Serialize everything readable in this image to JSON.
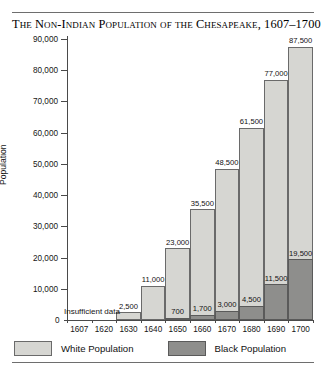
{
  "title": "The Non-Indian Population of the Chesapeake, 1607–1700",
  "axis": {
    "ylabel": "Population",
    "yticks": [
      "0",
      "10,000",
      "20,000",
      "30,000",
      "40,000",
      "50,000",
      "60,000",
      "70,000",
      "80,000",
      "90,000"
    ],
    "zero_label": "0"
  },
  "annotation": {
    "insufficient_data": "Insufficient data"
  },
  "legend": {
    "items": [
      {
        "label": "White Population",
        "color": "#d6d6d2",
        "swatch": "white-swatch"
      },
      {
        "label": "Black Population",
        "color": "#8e8e8c",
        "swatch": "black-swatch"
      }
    ]
  },
  "chart_data": {
    "type": "bar",
    "title": "The Non-Indian Population of the Chesapeake, 1607–1700",
    "xlabel": "",
    "ylabel": "Population",
    "ylim": [
      0,
      90000
    ],
    "ytick_step": 10000,
    "grid": false,
    "stacked": true,
    "legend_position": "bottom-left",
    "categories": [
      "1607",
      "1620",
      "1630",
      "1640",
      "1650",
      "1660",
      "1670",
      "1680",
      "1690",
      "1700"
    ],
    "series": [
      {
        "name": "White Population",
        "color": "#d6d6d2",
        "values": [
          null,
          null,
          2500,
          11000,
          23000,
          35500,
          48500,
          61500,
          77000,
          87500
        ],
        "labels": [
          "",
          "",
          "2,500",
          "11,000",
          "23,000",
          "35,500",
          "48,500",
          "61,500",
          "77,000",
          "87,500"
        ]
      },
      {
        "name": "Black Population",
        "color": "#8e8e8c",
        "values": [
          null,
          null,
          null,
          null,
          700,
          1700,
          3000,
          4500,
          11500,
          19500
        ],
        "labels": [
          "",
          "",
          "",
          "",
          "700",
          "1,700",
          "3,000",
          "4,500",
          "11,500",
          "19,500"
        ]
      }
    ],
    "annotations": [
      {
        "text": "Insufficient data",
        "categories": [
          "1607",
          "1620"
        ]
      }
    ]
  }
}
